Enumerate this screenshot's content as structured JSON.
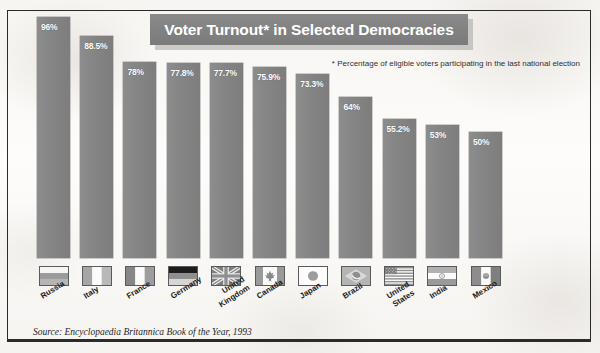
{
  "chart_data": {
    "type": "bar",
    "title": "Voter Turnout* in Selected Democracies",
    "footnote": "* Percentage of eligible voters participating\nin the last national election",
    "source": "Source: Encyclopaedia Britannica Book of the Year, 1993",
    "xlabel": "",
    "ylabel": "",
    "ylim": [
      0,
      100
    ],
    "grid": false,
    "legend": false,
    "categories": [
      "Russia",
      "Italy",
      "France",
      "Germany",
      "United Kingdom",
      "Canada",
      "Japan",
      "Brazil",
      "United States",
      "India",
      "Mexico"
    ],
    "values": [
      96,
      88.5,
      78,
      77.8,
      77.7,
      75.9,
      73.3,
      64,
      55.2,
      53,
      50
    ],
    "value_labels": [
      "96%",
      "88.5%",
      "78%",
      "77.8%",
      "77.7%",
      "75.9%",
      "73.3%",
      "64%",
      "55.2%",
      "53%",
      "50%"
    ],
    "bars": [
      {
        "country": "Russia",
        "label_line2": "",
        "value": 96,
        "label": "96%",
        "flag": "flag-russia"
      },
      {
        "country": "Italy",
        "label_line2": "",
        "value": 88.5,
        "label": "88.5%",
        "flag": "flag-italy"
      },
      {
        "country": "France",
        "label_line2": "",
        "value": 78,
        "label": "78%",
        "flag": "flag-france"
      },
      {
        "country": "Germany",
        "label_line2": "",
        "value": 77.8,
        "label": "77.8%",
        "flag": "flag-germany"
      },
      {
        "country": "United",
        "label_line2": "Kingdom",
        "value": 77.7,
        "label": "77.7%",
        "flag": "flag-united-kingdom"
      },
      {
        "country": "Canada",
        "label_line2": "",
        "value": 75.9,
        "label": "75.9%",
        "flag": "flag-canada"
      },
      {
        "country": "Japan",
        "label_line2": "",
        "value": 73.3,
        "label": "73.3%",
        "flag": "flag-japan"
      },
      {
        "country": "Brazil",
        "label_line2": "",
        "value": 64,
        "label": "64%",
        "flag": "flag-brazil"
      },
      {
        "country": "United",
        "label_line2": "States",
        "value": 55.2,
        "label": "55.2%",
        "flag": "flag-united-states"
      },
      {
        "country": "India",
        "label_line2": "",
        "value": 53,
        "label": "53%",
        "flag": "flag-india"
      },
      {
        "country": "Mexico",
        "label_line2": "",
        "value": 50,
        "label": "50%",
        "flag": "flag-mexico"
      }
    ],
    "colors": {
      "bar": "#868686",
      "title_bar": "#828282",
      "title_text": "#ffffff",
      "frame": "#2b2b2b",
      "background": "#f8f6f3",
      "label_text": "#ffffff"
    }
  }
}
